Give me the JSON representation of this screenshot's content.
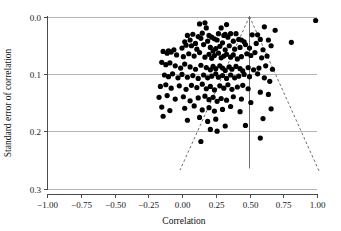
{
  "figure": {
    "kind": "funnel-plot",
    "background": "#ffffff",
    "point_color": "#000000",
    "grid_color": "#b4b4b4",
    "axis_color": "#4a4a4a"
  },
  "chart_data": {
    "type": "scatter",
    "title": "",
    "subtitle": "",
    "xlabel": "Correlation",
    "ylabel": "Standard error of correlation",
    "xlim": [
      -1.0,
      1.0
    ],
    "ylim": [
      0.3,
      0.0
    ],
    "y_inverted": true,
    "grid": true,
    "legend": null,
    "xticks": [
      -1.0,
      -0.75,
      -0.5,
      -0.25,
      0.0,
      0.25,
      0.5,
      0.75,
      1.0
    ],
    "xticklabels": [
      "-1.00",
      "-0.75",
      "-0.50",
      "-0.25",
      "0.00",
      "0.25",
      "0.50",
      "0.75",
      "1.00"
    ],
    "yticks": [
      0.0,
      0.1,
      0.2,
      0.3
    ],
    "yticklabels": [
      "0.0",
      "0.1",
      "0.2",
      "0.3"
    ],
    "gridlines_y": [
      0.0,
      0.1,
      0.2,
      0.3
    ],
    "annotations": [
      {
        "name": "vertical-reference-line",
        "type": "vline",
        "x": 0.5,
        "y_from": 0.0,
        "y_to": 0.265,
        "style": "solid"
      },
      {
        "name": "funnel-left-edge",
        "type": "line",
        "x_from": 0.5,
        "y_from": 0.0,
        "x_to": -0.015,
        "y_to": 0.268,
        "style": "dashed"
      },
      {
        "name": "funnel-right-edge",
        "type": "line",
        "x_from": 0.5,
        "y_from": 0.0,
        "x_to": 1.02,
        "y_to": 0.272,
        "style": "dashed"
      }
    ],
    "marker": "filled-circle",
    "marker_size_px": 5.2,
    "n_points": 186,
    "x": [
      0.13,
      0.17,
      0.18,
      0.29,
      0.33,
      0.61,
      0.69,
      0.99,
      0.56,
      0.32,
      0.4,
      0.44,
      0.04,
      0.08,
      0.12,
      0.15,
      0.2,
      0.24,
      0.27,
      0.31,
      0.36,
      0.02,
      0.06,
      0.1,
      0.14,
      0.19,
      0.22,
      0.26,
      0.3,
      0.34,
      0.38,
      0.42,
      0.46,
      0.52,
      0.58,
      0.64,
      0.81,
      -0.1,
      -0.06,
      0.0,
      0.03,
      0.07,
      0.11,
      0.16,
      0.21,
      0.23,
      0.25,
      0.28,
      0.32,
      0.35,
      0.39,
      0.43,
      0.47,
      0.5,
      0.55,
      0.6,
      0.66,
      -0.14,
      -0.11,
      -0.08,
      -0.04,
      0.01,
      0.05,
      0.09,
      0.13,
      0.17,
      0.2,
      0.22,
      0.24,
      0.27,
      0.29,
      0.31,
      0.33,
      0.36,
      0.38,
      0.41,
      0.44,
      0.48,
      0.51,
      0.54,
      0.59,
      0.63,
      -0.15,
      -0.12,
      -0.09,
      -0.05,
      -0.01,
      0.02,
      0.06,
      0.1,
      0.14,
      0.18,
      0.21,
      0.23,
      0.25,
      0.28,
      0.3,
      0.32,
      0.35,
      0.37,
      0.4,
      0.43,
      0.45,
      0.49,
      0.53,
      0.57,
      0.62,
      0.67,
      -0.13,
      -0.1,
      -0.07,
      -0.03,
      0.0,
      0.04,
      0.08,
      0.12,
      0.16,
      0.19,
      0.22,
      0.25,
      0.27,
      0.3,
      0.33,
      0.36,
      0.39,
      0.42,
      0.46,
      0.5,
      0.56,
      0.61,
      0.65,
      -0.16,
      -0.12,
      -0.08,
      -0.02,
      0.03,
      0.07,
      0.11,
      0.15,
      0.18,
      0.21,
      0.24,
      0.28,
      0.31,
      0.34,
      0.37,
      0.41,
      0.45,
      0.49,
      0.58,
      0.64,
      -0.17,
      -0.11,
      -0.05,
      0.01,
      0.06,
      0.12,
      0.17,
      0.2,
      0.23,
      0.26,
      0.29,
      0.33,
      0.38,
      0.44,
      0.51,
      0.66,
      -0.15,
      -0.09,
      0.02,
      0.09,
      0.15,
      0.2,
      0.24,
      0.3,
      0.36,
      0.43,
      0.6,
      -0.14,
      0.04,
      0.13,
      0.19,
      0.25,
      0.32,
      0.21,
      0.26,
      0.47,
      0.58,
      0.14,
      0.22
    ],
    "y": [
      0.013,
      0.011,
      0.02,
      0.02,
      0.014,
      0.018,
      0.024,
      0.007,
      0.032,
      0.031,
      0.03,
      0.041,
      0.033,
      0.031,
      0.035,
      0.029,
      0.033,
      0.039,
      0.03,
      0.033,
      0.03,
      0.044,
      0.041,
      0.047,
      0.038,
      0.043,
      0.036,
      0.041,
      0.046,
      0.036,
      0.043,
      0.04,
      0.044,
      0.032,
      0.04,
      0.041,
      0.045,
      0.06,
      0.058,
      0.055,
      0.05,
      0.051,
      0.057,
      0.049,
      0.054,
      0.06,
      0.056,
      0.052,
      0.058,
      0.051,
      0.057,
      0.054,
      0.049,
      0.055,
      0.047,
      0.058,
      0.051,
      0.061,
      0.064,
      0.062,
      0.067,
      0.07,
      0.065,
      0.069,
      0.063,
      0.071,
      0.066,
      0.073,
      0.068,
      0.064,
      0.072,
      0.069,
      0.066,
      0.071,
      0.067,
      0.074,
      0.07,
      0.065,
      0.068,
      0.063,
      0.072,
      0.069,
      0.08,
      0.084,
      0.081,
      0.086,
      0.09,
      0.083,
      0.088,
      0.092,
      0.085,
      0.089,
      0.093,
      0.087,
      0.091,
      0.086,
      0.09,
      0.094,
      0.088,
      0.092,
      0.087,
      0.091,
      0.095,
      0.089,
      0.093,
      0.09,
      0.086,
      0.092,
      0.102,
      0.105,
      0.1,
      0.107,
      0.101,
      0.106,
      0.103,
      0.108,
      0.102,
      0.107,
      0.104,
      0.1,
      0.106,
      0.103,
      0.108,
      0.102,
      0.107,
      0.104,
      0.101,
      0.105,
      0.1,
      0.107,
      0.113,
      0.122,
      0.119,
      0.125,
      0.121,
      0.127,
      0.12,
      0.124,
      0.118,
      0.126,
      0.122,
      0.128,
      0.121,
      0.125,
      0.119,
      0.127,
      0.123,
      0.12,
      0.126,
      0.132,
      0.136,
      0.141,
      0.138,
      0.144,
      0.14,
      0.147,
      0.142,
      0.139,
      0.145,
      0.141,
      0.148,
      0.143,
      0.146,
      0.14,
      0.144,
      0.15,
      0.161,
      0.158,
      0.164,
      0.16,
      0.156,
      0.163,
      0.159,
      0.165,
      0.162,
      0.157,
      0.166,
      0.178,
      0.174,
      0.181,
      0.176,
      0.183,
      0.179,
      0.191,
      0.197,
      0.2,
      0.19,
      0.212,
      0.218
    ]
  }
}
